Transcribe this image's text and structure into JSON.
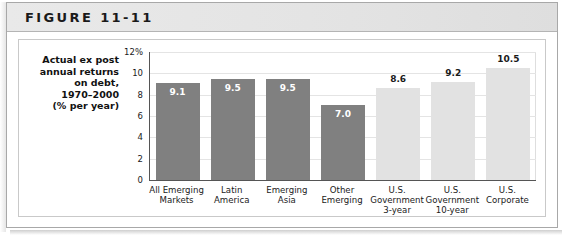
{
  "figure": {
    "header_label": "FIGURE 11-11"
  },
  "caption": {
    "lines": [
      "Actual ex post",
      "annual returns",
      "on debt,",
      "1970–2000",
      "(% per year)"
    ]
  },
  "colors": {
    "bar_dark": "#808080",
    "bar_light": "#e2e2e2",
    "header_band": "#e6e6e6",
    "axis_line": "#555555",
    "gridline": "#e4e4e4"
  },
  "chart_data": {
    "type": "bar",
    "title": "FIGURE 11-11",
    "xlabel": "",
    "ylabel": "Actual ex post annual returns on debt, 1970–2000 (% per year)",
    "ylim": [
      0,
      12
    ],
    "yticks": [
      0,
      2,
      4,
      6,
      8,
      10,
      12
    ],
    "ytick_labels": [
      "0",
      "2",
      "4",
      "6",
      "8",
      "10",
      "12%"
    ],
    "grid": true,
    "legend": "none",
    "categories": [
      "All Emerging Markets",
      "Latin America",
      "Emerging Asia",
      "Other Emerging",
      "U.S. Government 3-year",
      "U.S. Government 10-year",
      "U.S. Corporate"
    ],
    "category_lines": [
      [
        "All Emerging",
        "Markets"
      ],
      [
        "Latin",
        "America"
      ],
      [
        "Emerging",
        "Asia"
      ],
      [
        "Other",
        "Emerging"
      ],
      [
        "U.S.",
        "Government",
        "3-year"
      ],
      [
        "U.S.",
        "Government",
        "10-year"
      ],
      [
        "U.S.",
        "Corporate"
      ]
    ],
    "values": [
      9.1,
      9.5,
      9.5,
      7.0,
      8.6,
      9.2,
      10.5
    ],
    "value_labels": [
      "9.1",
      "9.5",
      "9.5",
      "7.0",
      "8.6",
      "9.2",
      "10.5"
    ],
    "series_groups": [
      {
        "name": "Emerging market debt",
        "color": "#808080",
        "indices": [
          0,
          1,
          2,
          3
        ]
      },
      {
        "name": "U.S. debt",
        "color": "#e2e2e2",
        "indices": [
          4,
          5,
          6
        ]
      }
    ]
  }
}
